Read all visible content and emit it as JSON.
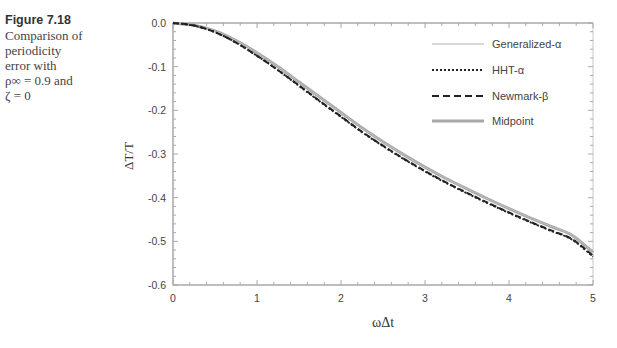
{
  "caption": {
    "figure_number": "Figure 7.18",
    "lines": [
      "Comparison of",
      "periodicity",
      "error with",
      "ρ∞ = 0.9 and",
      "ζ = 0"
    ]
  },
  "chart_data": {
    "type": "line",
    "title": "",
    "xlabel": "ωΔt",
    "ylabel": "ΔT/T",
    "xlim": [
      0,
      5
    ],
    "ylim": [
      -0.6,
      0.0
    ],
    "x_ticks": [
      "0",
      "1",
      "2",
      "3",
      "4",
      "5"
    ],
    "y_ticks": [
      "0.0",
      "-0.1",
      "-0.2",
      "-0.3",
      "-0.4",
      "-0.5",
      "-0.6"
    ],
    "grid": false,
    "legend_position": "upper right (inside)",
    "x": [
      0,
      0.25,
      0.5,
      0.75,
      1.0,
      1.25,
      1.5,
      1.75,
      2.0,
      2.25,
      2.5,
      2.75,
      3.0,
      3.25,
      3.5,
      3.75,
      4.0,
      4.25,
      4.5,
      4.75,
      5.0
    ],
    "series": [
      {
        "name": "Generalized-α",
        "style": "solid thin",
        "color": "#9a9a9a",
        "values": [
          0,
          -0.005,
          -0.018,
          -0.04,
          -0.068,
          -0.1,
          -0.135,
          -0.17,
          -0.205,
          -0.24,
          -0.272,
          -0.302,
          -0.33,
          -0.356,
          -0.38,
          -0.403,
          -0.425,
          -0.446,
          -0.466,
          -0.486,
          -0.525
        ]
      },
      {
        "name": "HHT-α",
        "style": "dotted",
        "color": "#222222",
        "values": [
          0,
          -0.006,
          -0.021,
          -0.045,
          -0.075,
          -0.108,
          -0.144,
          -0.18,
          -0.215,
          -0.25,
          -0.282,
          -0.312,
          -0.34,
          -0.366,
          -0.39,
          -0.413,
          -0.435,
          -0.456,
          -0.476,
          -0.496,
          -0.535
        ]
      },
      {
        "name": "Newmark-β",
        "style": "dashed",
        "color": "#222222",
        "values": [
          0,
          -0.006,
          -0.021,
          -0.045,
          -0.075,
          -0.108,
          -0.143,
          -0.179,
          -0.214,
          -0.249,
          -0.281,
          -0.311,
          -0.339,
          -0.365,
          -0.389,
          -0.412,
          -0.434,
          -0.455,
          -0.475,
          -0.495,
          -0.533
        ]
      },
      {
        "name": "Midpoint",
        "style": "solid thick",
        "color": "#a0a0a0",
        "values": [
          0,
          -0.005,
          -0.018,
          -0.04,
          -0.068,
          -0.1,
          -0.135,
          -0.17,
          -0.205,
          -0.24,
          -0.272,
          -0.302,
          -0.33,
          -0.356,
          -0.38,
          -0.403,
          -0.425,
          -0.446,
          -0.466,
          -0.486,
          -0.525
        ]
      }
    ]
  }
}
